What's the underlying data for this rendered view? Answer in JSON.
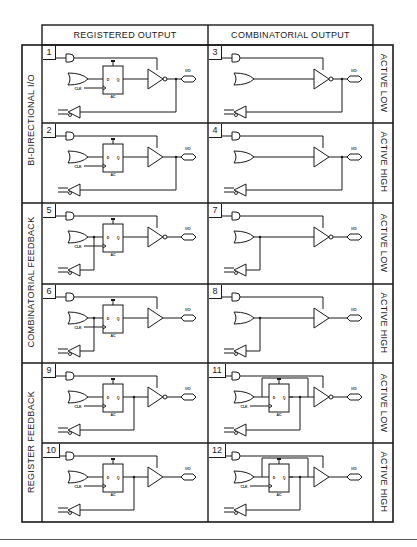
{
  "header": {
    "col1": "REGISTERED OUTPUT",
    "col2": "COMBINATORIAL OUTPUT"
  },
  "groups": [
    {
      "label": "BI-DIRECTIONAL I/O"
    },
    {
      "label": "COMBINATORIAL FEEDBACK"
    },
    {
      "label": "REGISTER FEEDBACK"
    }
  ],
  "polarity": [
    {
      "label": "ACTIVE LOW"
    },
    {
      "label": "ACTIVE HIGH"
    },
    {
      "label": "ACTIVE LOW"
    },
    {
      "label": "ACTIVE HIGH"
    },
    {
      "label": "ACTIVE LOW"
    },
    {
      "label": "ACTIVE HIGH"
    }
  ],
  "cells": [
    {
      "num": "1",
      "kind": "reg",
      "inverted": true,
      "feedback": "io"
    },
    {
      "num": "3",
      "kind": "comb",
      "inverted": true,
      "feedback": "io"
    },
    {
      "num": "2",
      "kind": "reg",
      "inverted": false,
      "feedback": "io"
    },
    {
      "num": "4",
      "kind": "comb",
      "inverted": false,
      "feedback": "io"
    },
    {
      "num": "5",
      "kind": "reg",
      "inverted": true,
      "feedback": "comb"
    },
    {
      "num": "7",
      "kind": "comb",
      "inverted": true,
      "feedback": "comb"
    },
    {
      "num": "6",
      "kind": "reg",
      "inverted": false,
      "feedback": "comb"
    },
    {
      "num": "8",
      "kind": "comb",
      "inverted": false,
      "feedback": "comb"
    },
    {
      "num": "9",
      "kind": "reg",
      "inverted": true,
      "feedback": "reg"
    },
    {
      "num": "11",
      "kind": "regcomb",
      "inverted": true,
      "feedback": "reg"
    },
    {
      "num": "10",
      "kind": "reg",
      "inverted": false,
      "feedback": "reg"
    },
    {
      "num": "12",
      "kind": "regcomb",
      "inverted": false,
      "feedback": "reg"
    }
  ],
  "symbols": {
    "clk": "CLK",
    "d": "D",
    "q": "Q",
    "sp": "SP",
    "ac": "AC",
    "io": "I/O"
  },
  "colors": {
    "line": "#1a1a1a",
    "background": "#ffffff"
  }
}
